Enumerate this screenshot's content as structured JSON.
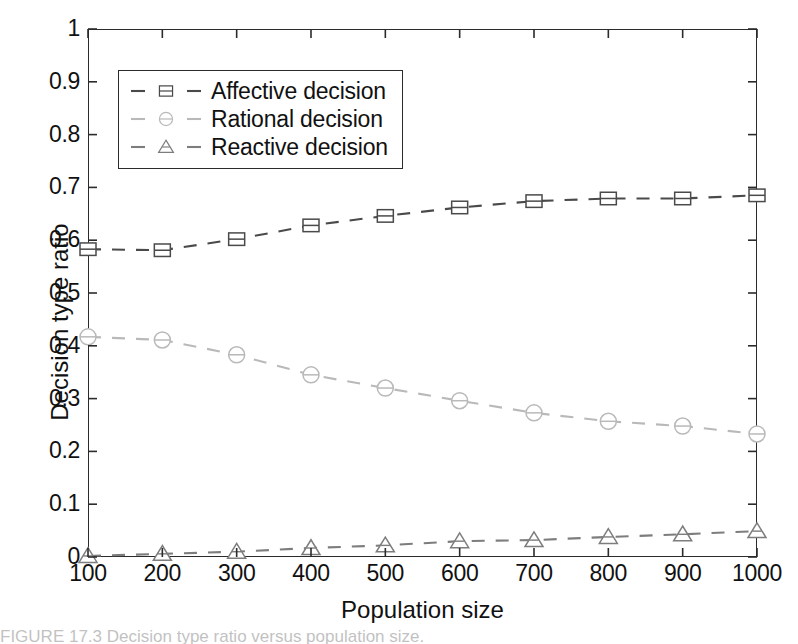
{
  "chart_data": {
    "type": "line",
    "title": "",
    "xlabel": "Population size",
    "ylabel": "Decision type ratio",
    "x": [
      100,
      200,
      300,
      400,
      500,
      600,
      700,
      800,
      900,
      1000
    ],
    "xlim": [
      100,
      1000
    ],
    "ylim": [
      0,
      1
    ],
    "xticks": [
      "100",
      "200",
      "300",
      "400",
      "500",
      "600",
      "700",
      "800",
      "900",
      "1000"
    ],
    "yticks": [
      "0",
      "0.1",
      "0.2",
      "0.3",
      "0.4",
      "0.5",
      "0.6",
      "0.7",
      "0.8",
      "0.9",
      "1"
    ],
    "grid": false,
    "legend_position": "upper left",
    "series": [
      {
        "name": "Affective decision",
        "marker": "square",
        "linestyle": "dashed",
        "color": "#4a4a4a",
        "values": [
          0.583,
          0.581,
          0.602,
          0.628,
          0.646,
          0.662,
          0.674,
          0.679,
          0.679,
          0.685
        ]
      },
      {
        "name": "Rational decision",
        "marker": "circle",
        "linestyle": "dashed",
        "color": "#b9b9b9",
        "values": [
          0.417,
          0.411,
          0.383,
          0.345,
          0.32,
          0.296,
          0.273,
          0.257,
          0.248,
          0.233
        ]
      },
      {
        "name": "Reactive decision",
        "marker": "triangle",
        "linestyle": "dashed",
        "color": "#7d7d7d",
        "values": [
          0.002,
          0.006,
          0.01,
          0.017,
          0.022,
          0.03,
          0.032,
          0.038,
          0.043,
          0.049
        ]
      }
    ]
  },
  "legend": {
    "items": [
      {
        "label": "Affective decision"
      },
      {
        "label": "Rational decision"
      },
      {
        "label": "Reactive decision"
      }
    ]
  },
  "axes": {
    "x_title": "Population size",
    "y_title": "Decision type ratio"
  },
  "caption": {
    "text": "FIGURE 17.3  Decision type ratio versus population size."
  },
  "colors": {
    "frame": "#2b2b2b",
    "affective": "#4a4a4a",
    "rational": "#b9b9b9",
    "reactive": "#7d7d7d",
    "background": "#ffffff"
  }
}
